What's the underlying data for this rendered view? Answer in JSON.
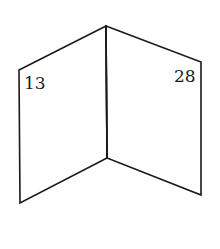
{
  "figure": {
    "type": "open-book-dihedral",
    "stroke_color": "#1a1a1a",
    "background": "#ffffff",
    "vertices": {
      "spine_top": [
        106,
        26
      ],
      "spine_bottom": [
        107,
        158
      ],
      "left_top": [
        19,
        70
      ],
      "left_bottom": [
        20,
        203
      ],
      "right_top": [
        201,
        62
      ],
      "right_bottom": [
        201,
        195
      ]
    },
    "faces": [
      {
        "name": "left-face",
        "label": "13",
        "label_pos": [
          24,
          89
        ]
      },
      {
        "name": "right-face",
        "label": "28",
        "label_pos": [
          174,
          82
        ]
      }
    ]
  }
}
